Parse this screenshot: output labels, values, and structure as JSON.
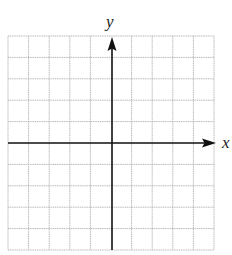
{
  "diagram": {
    "type": "coordinate-grid",
    "axes": {
      "x_label": "x",
      "y_label": "y"
    },
    "grid": {
      "columns": 10,
      "rows": 10,
      "line_color": "#b8b8b8",
      "axis_color": "#111111"
    }
  }
}
